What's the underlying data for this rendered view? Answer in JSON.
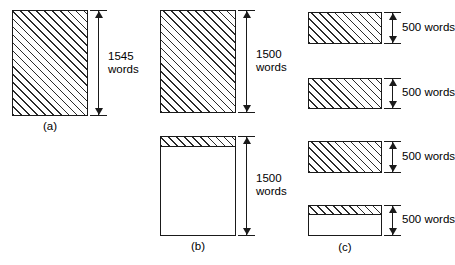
{
  "figure": {
    "background_color": "#ffffff",
    "line_color": "#1a1a1a",
    "hatch_color": "#2b2b2b",
    "panels": [
      {
        "id": "a",
        "caption": "(a)",
        "boxes": [
          {
            "name": "block-a-1",
            "dimension_value": "1545",
            "dimension_unit": "words",
            "dimension_text_line1": "1545",
            "dimension_text_line2": "words",
            "fill": "full-hatch"
          }
        ]
      },
      {
        "id": "b",
        "caption": "(b)",
        "boxes": [
          {
            "name": "block-b-1",
            "dimension_value": "1500",
            "dimension_unit": "words",
            "dimension_text_line1": "1500",
            "dimension_text_line2": "words",
            "fill": "full-hatch"
          },
          {
            "name": "block-b-2",
            "dimension_value": "1500",
            "dimension_unit": "words",
            "dimension_text_line1": "1500",
            "dimension_text_line2": "words",
            "fill": "top-strip-hatch"
          }
        ]
      },
      {
        "id": "c",
        "caption": "(c)",
        "boxes": [
          {
            "name": "block-c-1",
            "dimension_value": "500",
            "dimension_unit": "words",
            "dimension_text": "500 words",
            "fill": "full-hatch"
          },
          {
            "name": "block-c-2",
            "dimension_value": "500",
            "dimension_unit": "words",
            "dimension_text": "500 words",
            "fill": "full-hatch"
          },
          {
            "name": "block-c-3",
            "dimension_value": "500",
            "dimension_unit": "words",
            "dimension_text": "500 words",
            "fill": "full-hatch"
          },
          {
            "name": "block-c-4",
            "dimension_value": "500",
            "dimension_unit": "words",
            "dimension_text": "500 words",
            "fill": "top-strip-hatch"
          }
        ]
      }
    ]
  }
}
